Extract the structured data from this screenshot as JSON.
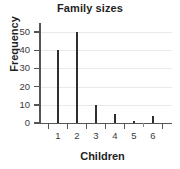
{
  "chart_data": {
    "type": "bar",
    "title": "Family sizes",
    "xlabel": "Children",
    "ylabel": "Frequency",
    "categories": [
      "1",
      "2",
      "3",
      "4",
      "5",
      "6"
    ],
    "values": [
      40,
      50,
      10,
      5,
      1,
      4
    ],
    "ylim": [
      0,
      55
    ],
    "yticks": [
      0,
      10,
      20,
      30,
      40,
      50
    ],
    "ytick_labels": [
      "0",
      "10",
      "20",
      "30",
      "40",
      "50"
    ],
    "grid": "horizontal",
    "legend": "none",
    "bar_color": "#2e2e2e",
    "grid_color": "#e9e9e9",
    "axis_color": "#555555"
  }
}
